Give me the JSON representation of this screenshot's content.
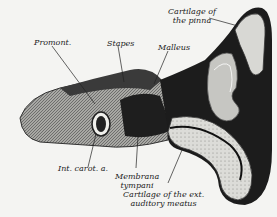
{
  "figure": {
    "labels": {
      "promont": "Promont.",
      "stapes": "Stapes",
      "malleus": "Malleus",
      "pinna_line1": "Cartilage of",
      "pinna_line2": "the pinna",
      "carot": "Int. carot. a.",
      "membrana_line1": "Membrana",
      "membrana_line2": "tympani",
      "meatus_line1": "Cartilage of the ext.",
      "meatus_line2": "auditory meatus"
    }
  },
  "colors": {
    "paper": "#f4f4f2",
    "ink": "#222222",
    "dark": "#2a2a2a",
    "mid": "#7a7a7a",
    "light": "#c8c8c4"
  }
}
